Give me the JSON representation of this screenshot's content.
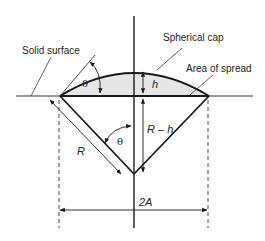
{
  "diagram": {
    "labels": {
      "solid_surface": "Solid surface",
      "spherical_cap": "Spherical cap",
      "area_of_spread": "Area of spread",
      "theta_top": "θ",
      "theta_bottom": "θ",
      "h": "h",
      "R": "R",
      "R_minus_h": "R – h",
      "two_A": "2A"
    },
    "colors": {
      "line": "#1a1a1a",
      "cap_fill": "#e6e6e6",
      "background": "#ffffff"
    }
  }
}
